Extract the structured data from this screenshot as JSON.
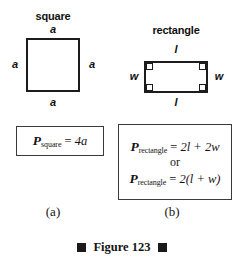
{
  "figure": {
    "caption": "Figure 123",
    "caption_marker": "filled-square",
    "ink_color": "#1a1a1a",
    "background_color": "#ffffff"
  },
  "panels": [
    {
      "letter": "(a)",
      "shape": {
        "name": "square",
        "title": "square",
        "side_labels": {
          "top": "a",
          "left": "a",
          "right": "a",
          "bottom": "a"
        }
      },
      "formulas": [
        {
          "symbol": "P",
          "subscript": "square",
          "equals": "=",
          "expression": "4a"
        }
      ]
    },
    {
      "letter": "(b)",
      "shape": {
        "name": "rectangle",
        "title": "rectangle",
        "side_labels": {
          "top": "l",
          "left": "w",
          "right": "w",
          "bottom": "l"
        },
        "corner_marks": "right-angle"
      },
      "formulas": [
        {
          "symbol": "P",
          "subscript": "rectangle",
          "equals": "=",
          "expression_parts": [
            "2",
            "l",
            " + ",
            "2",
            "w"
          ],
          "expression": "2l + 2w"
        },
        {
          "connector": "or"
        },
        {
          "symbol": "P",
          "subscript": "rectangle",
          "equals": "=",
          "expression_parts": [
            "2(",
            "l",
            " + ",
            "w",
            ")"
          ],
          "expression": "2(l + w)"
        }
      ]
    }
  ]
}
